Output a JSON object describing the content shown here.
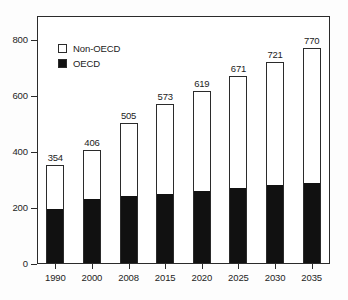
{
  "chart_data": {
    "type": "bar",
    "stacked": true,
    "title": "",
    "subtitle": "",
    "xlabel": "",
    "ylabel": "",
    "categories": [
      "1990",
      "2000",
      "2008",
      "2015",
      "2020",
      "2025",
      "2030",
      "2035"
    ],
    "series": [
      {
        "name": "OECD",
        "color": "#111111",
        "values": [
          193,
          230,
          238,
          247,
          257,
          268,
          278,
          285
        ]
      },
      {
        "name": "Non-OECD",
        "color": "#ffffff",
        "values": [
          161,
          176,
          267,
          326,
          362,
          403,
          443,
          485
        ]
      }
    ],
    "totals": [
      354,
      406,
      505,
      573,
      619,
      671,
      721,
      770
    ],
    "data_labels": [
      "354",
      "406",
      "505",
      "573",
      "619",
      "671",
      "721",
      "770"
    ],
    "ylim": [
      0,
      886
    ],
    "yticks": [
      0,
      200,
      400,
      600,
      800
    ],
    "ytick_labels": [
      "0",
      "200",
      "400",
      "600",
      "800"
    ],
    "xtick_labels": [
      "1990",
      "2000",
      "2008",
      "2015",
      "2020",
      "2025",
      "2030",
      "2035"
    ],
    "grid": false,
    "legend_position": "top-left",
    "legend": [
      {
        "label": "Non-OECD",
        "swatch": "hollow"
      },
      {
        "label": "OECD",
        "swatch": "filled"
      }
    ]
  },
  "colors": {
    "oecd": "#111111",
    "non_oecd": "#ffffff",
    "axis": "#2b2b2b",
    "background": "#fdfdfd",
    "text": "#222222"
  }
}
